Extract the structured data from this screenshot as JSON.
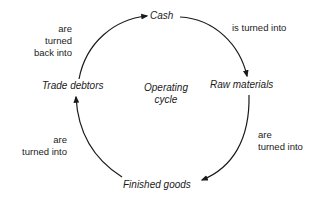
{
  "diagram": {
    "type": "cycle",
    "center_label": {
      "line1": "Operating",
      "line2": "cycle"
    },
    "nodes": [
      {
        "id": "cash",
        "label": "Cash"
      },
      {
        "id": "raw",
        "label": "Raw materials"
      },
      {
        "id": "finished",
        "label": "Finished goods"
      },
      {
        "id": "debtors",
        "label": "Trade debtors"
      }
    ],
    "edges": [
      {
        "from": "cash",
        "to": "raw",
        "lines": [
          "is turned into"
        ]
      },
      {
        "from": "raw",
        "to": "finished",
        "lines": [
          "are",
          "turned into"
        ]
      },
      {
        "from": "finished",
        "to": "debtors",
        "lines": [
          "are",
          "turned into"
        ]
      },
      {
        "from": "debtors",
        "to": "cash",
        "lines": [
          "are",
          "turned",
          "back into"
        ]
      }
    ],
    "colors": {
      "line": "#1a1a1a",
      "text": "#1a1a1a",
      "background": "#ffffff"
    }
  }
}
